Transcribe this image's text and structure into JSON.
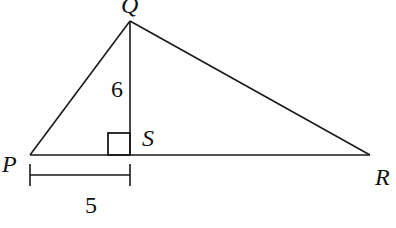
{
  "diagram": {
    "type": "right-triangle-with-altitude",
    "points": {
      "P": {
        "label": "P",
        "x": 30,
        "y": 155
      },
      "Q": {
        "label": "Q",
        "x": 130,
        "y": 21
      },
      "R": {
        "label": "R",
        "x": 370,
        "y": 155
      },
      "S": {
        "label": "S",
        "x": 130,
        "y": 155
      }
    },
    "segments": [
      {
        "from": "P",
        "to": "Q"
      },
      {
        "from": "Q",
        "to": "R"
      },
      {
        "from": "P",
        "to": "R"
      },
      {
        "from": "Q",
        "to": "S",
        "role": "altitude"
      }
    ],
    "right_angle_at": "S",
    "measurements": {
      "QS": {
        "label": "6",
        "segment": "Q-S"
      },
      "PS": {
        "label": "5",
        "segment": "P-S"
      }
    },
    "stroke_color": "#1a1a1a"
  }
}
